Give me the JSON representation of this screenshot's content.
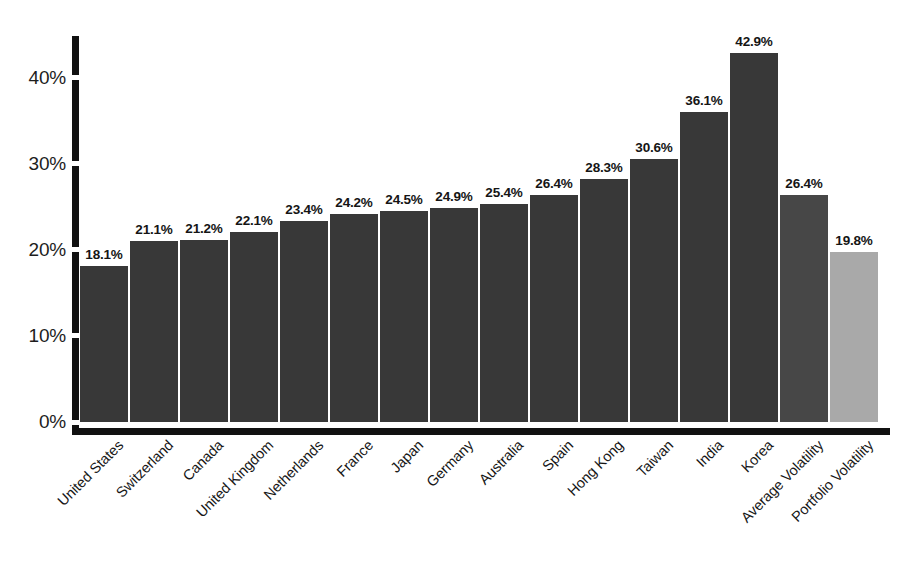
{
  "chart_data": {
    "type": "bar",
    "title": "",
    "subtitle": "",
    "xlabel": "",
    "ylabel": "",
    "ylim": [
      0,
      45
    ],
    "grid": false,
    "legend": "none",
    "y_ticks": [
      "0%",
      "10%",
      "20%",
      "30%",
      "40%"
    ],
    "y_tick_values": [
      0,
      10,
      20,
      30,
      40
    ],
    "categories": [
      "United States",
      "Switzerland",
      "Canada",
      "United Kingdom",
      "Netherlands",
      "France",
      "Japan",
      "Germany",
      "Australia",
      "Spain",
      "Hong Kong",
      "Taiwan",
      "India",
      "Korea",
      "Average Volatility",
      "Portfolio Volatility"
    ],
    "values": [
      18.1,
      21.1,
      21.2,
      22.1,
      23.4,
      24.2,
      24.5,
      24.9,
      25.4,
      26.4,
      28.3,
      30.6,
      36.1,
      42.9,
      26.4,
      19.8
    ],
    "data_labels": [
      "18.1%",
      "21.1%",
      "21.2%",
      "22.1%",
      "23.4%",
      "24.2%",
      "24.5%",
      "24.9%",
      "25.4%",
      "26.4%",
      "28.3%",
      "30.6%",
      "36.1%",
      "42.9%",
      "26.4%",
      "19.8%"
    ],
    "bar_colors": [
      "#383838",
      "#383838",
      "#383838",
      "#383838",
      "#383838",
      "#383838",
      "#383838",
      "#383838",
      "#383838",
      "#383838",
      "#383838",
      "#383838",
      "#383838",
      "#383838",
      "#474747",
      "#a9a9a9"
    ],
    "series": [
      {
        "name": "Volatility",
        "values": [
          18.1,
          21.1,
          21.2,
          22.1,
          23.4,
          24.2,
          24.5,
          24.9,
          25.4,
          26.4,
          28.3,
          30.6,
          36.1,
          42.9,
          26.4,
          19.8
        ]
      }
    ],
    "colors": {
      "country_bar": "#383838",
      "average_volatility_bar": "#474747",
      "portfolio_volatility_bar": "#a9a9a9",
      "axis": "#111111",
      "background": "#ffffff",
      "text": "#1a1a1a"
    }
  }
}
